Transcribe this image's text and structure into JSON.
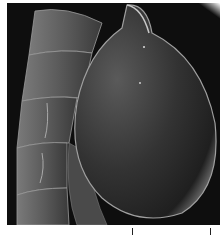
{
  "image": {
    "kind": "scanning electron micrograph",
    "colors": {
      "background": "#0e0e0e",
      "frame": "#ffffff",
      "ticks": "#222222"
    }
  },
  "scale_bar": {
    "ticks_x": [
      132,
      210
    ],
    "label": ""
  }
}
